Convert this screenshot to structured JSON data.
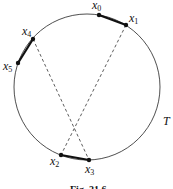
{
  "figure": {
    "caption": "Fig. 21.6",
    "curve_label": "T",
    "circle": {
      "cx": 87,
      "cy": 87,
      "r": 73
    },
    "points": [
      {
        "name": "x",
        "sub": "0",
        "x": 99,
        "y": 15,
        "lx": 92,
        "ly": 9
      },
      {
        "name": "x",
        "sub": "1",
        "x": 126,
        "y": 25,
        "lx": 129,
        "ly": 22
      },
      {
        "name": "x",
        "sub": "2",
        "x": 61,
        "y": 155,
        "lx": 50,
        "ly": 165
      },
      {
        "name": "x",
        "sub": "3",
        "x": 89,
        "y": 160,
        "lx": 85,
        "ly": 173
      },
      {
        "name": "x",
        "sub": "4",
        "x": 33,
        "y": 39,
        "lx": 22,
        "ly": 35
      },
      {
        "name": "x",
        "sub": "5",
        "x": 18,
        "y": 63,
        "lx": 3,
        "ly": 70
      }
    ],
    "solid_arcs": [
      [
        "x0",
        "x1"
      ],
      [
        "x2",
        "x3"
      ],
      [
        "x4",
        "x5"
      ]
    ],
    "dashed_chords": [
      [
        "x1",
        "x2"
      ],
      [
        "x4",
        "x3"
      ]
    ],
    "colors": {
      "stroke": "#111111",
      "background": "#ffffff"
    }
  }
}
